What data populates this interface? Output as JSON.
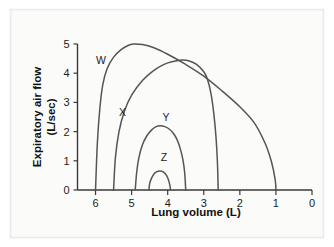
{
  "chart_data": {
    "type": "line",
    "title": "",
    "subtitle": "",
    "xlabel": "Lung volume (L)",
    "ylabel": "Expiratory air flow (L/sec)",
    "ylabel_line1": "Expiratory air flow",
    "ylabel_line2": "(L/sec)",
    "xlim": [
      6.5,
      0.0
    ],
    "ylim": [
      0,
      5
    ],
    "x_axis_reversed": true,
    "xticks": [
      6,
      5,
      4,
      3,
      2,
      1,
      0
    ],
    "xtick_labels": [
      "6",
      "5",
      "4",
      "3",
      "2",
      "1",
      "0"
    ],
    "yticks": [
      0,
      1,
      2,
      3,
      4,
      5
    ],
    "ytick_labels": [
      "0",
      "1",
      "2",
      "3",
      "4",
      "5"
    ],
    "grid": false,
    "legend_position": "inline-curve-labels",
    "line_color": "#555555",
    "annotations": [
      {
        "text": "W",
        "x": 5.85,
        "y": 4.3
      },
      {
        "text": "X",
        "x": 5.25,
        "y": 2.55
      },
      {
        "text": "Y",
        "x": 4.05,
        "y": 2.35
      },
      {
        "text": "Z",
        "x": 4.1,
        "y": 1.0
      }
    ],
    "series": [
      {
        "name": "W",
        "label": "W",
        "description": "Normal maximal expiratory flow-volume loop",
        "peak_flow": 5.0,
        "peak_volume": 4.95,
        "start_volume": 6.0,
        "end_volume": 1.0,
        "points": [
          {
            "x": 6.0,
            "y": 0.0
          },
          {
            "x": 5.95,
            "y": 1.6
          },
          {
            "x": 5.88,
            "y": 2.8
          },
          {
            "x": 5.8,
            "y": 3.6
          },
          {
            "x": 5.68,
            "y": 4.15
          },
          {
            "x": 5.5,
            "y": 4.55
          },
          {
            "x": 5.3,
            "y": 4.8
          },
          {
            "x": 5.1,
            "y": 4.95
          },
          {
            "x": 4.95,
            "y": 5.0
          },
          {
            "x": 4.7,
            "y": 4.98
          },
          {
            "x": 4.4,
            "y": 4.88
          },
          {
            "x": 4.0,
            "y": 4.65
          },
          {
            "x": 3.5,
            "y": 4.3
          },
          {
            "x": 3.0,
            "y": 3.9
          },
          {
            "x": 2.5,
            "y": 3.4
          },
          {
            "x": 2.0,
            "y": 2.85
          },
          {
            "x": 1.6,
            "y": 2.3
          },
          {
            "x": 1.3,
            "y": 1.6
          },
          {
            "x": 1.12,
            "y": 0.95
          },
          {
            "x": 1.02,
            "y": 0.35
          },
          {
            "x": 1.0,
            "y": 0.0
          }
        ]
      },
      {
        "name": "X",
        "label": "X",
        "description": "Reduced lung volume curve",
        "peak_flow": 4.45,
        "peak_volume": 3.6,
        "start_volume": 5.5,
        "end_volume": 2.6,
        "points": [
          {
            "x": 5.5,
            "y": 0.0
          },
          {
            "x": 5.45,
            "y": 1.1
          },
          {
            "x": 5.35,
            "y": 2.0
          },
          {
            "x": 5.2,
            "y": 2.7
          },
          {
            "x": 5.0,
            "y": 3.25
          },
          {
            "x": 4.7,
            "y": 3.75
          },
          {
            "x": 4.4,
            "y": 4.08
          },
          {
            "x": 4.1,
            "y": 4.3
          },
          {
            "x": 3.85,
            "y": 4.4
          },
          {
            "x": 3.6,
            "y": 4.45
          },
          {
            "x": 3.4,
            "y": 4.42
          },
          {
            "x": 3.2,
            "y": 4.3
          },
          {
            "x": 3.0,
            "y": 4.05
          },
          {
            "x": 2.9,
            "y": 3.8
          },
          {
            "x": 2.8,
            "y": 3.3
          },
          {
            "x": 2.72,
            "y": 2.6
          },
          {
            "x": 2.66,
            "y": 1.8
          },
          {
            "x": 2.62,
            "y": 0.9
          },
          {
            "x": 2.6,
            "y": 0.0
          }
        ]
      },
      {
        "name": "Y",
        "label": "Y",
        "description": "Further reduced flow-volume curve",
        "peak_flow": 2.2,
        "peak_volume": 4.2,
        "start_volume": 4.9,
        "end_volume": 3.5,
        "points": [
          {
            "x": 4.9,
            "y": 0.0
          },
          {
            "x": 4.86,
            "y": 0.6
          },
          {
            "x": 4.8,
            "y": 1.1
          },
          {
            "x": 4.7,
            "y": 1.55
          },
          {
            "x": 4.58,
            "y": 1.85
          },
          {
            "x": 4.45,
            "y": 2.05
          },
          {
            "x": 4.32,
            "y": 2.17
          },
          {
            "x": 4.2,
            "y": 2.2
          },
          {
            "x": 4.08,
            "y": 2.17
          },
          {
            "x": 3.95,
            "y": 2.08
          },
          {
            "x": 3.85,
            "y": 1.95
          },
          {
            "x": 3.75,
            "y": 1.75
          },
          {
            "x": 3.66,
            "y": 1.45
          },
          {
            "x": 3.58,
            "y": 1.05
          },
          {
            "x": 3.53,
            "y": 0.6
          },
          {
            "x": 3.5,
            "y": 0.0
          }
        ]
      },
      {
        "name": "Z",
        "label": "Z",
        "description": "Severely reduced flow-volume curve",
        "peak_flow": 0.65,
        "peak_volume": 4.22,
        "start_volume": 4.52,
        "end_volume": 3.92,
        "points": [
          {
            "x": 4.52,
            "y": 0.0
          },
          {
            "x": 4.5,
            "y": 0.22
          },
          {
            "x": 4.45,
            "y": 0.4
          },
          {
            "x": 4.38,
            "y": 0.55
          },
          {
            "x": 4.3,
            "y": 0.63
          },
          {
            "x": 4.22,
            "y": 0.65
          },
          {
            "x": 4.14,
            "y": 0.63
          },
          {
            "x": 4.06,
            "y": 0.55
          },
          {
            "x": 4.0,
            "y": 0.42
          },
          {
            "x": 3.95,
            "y": 0.22
          },
          {
            "x": 3.92,
            "y": 0.0
          }
        ]
      }
    ]
  }
}
